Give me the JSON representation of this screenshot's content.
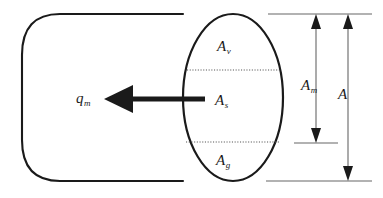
{
  "figure": {
    "type": "cylinder-cross-section-area-diagram",
    "colors": {
      "outline": "#1a1a1a",
      "dotted_divider": "#555555",
      "dimension_line": "#555555",
      "arrow": "#1a1a1a",
      "background": "#ffffff"
    }
  },
  "labels": {
    "area_vapour": {
      "base": "A",
      "sub": "v"
    },
    "area_solid": {
      "base": "A",
      "sub": "s"
    },
    "area_gas": {
      "base": "A",
      "sub": "g"
    },
    "mass_flux": {
      "base": "q",
      "sub": "m"
    },
    "area_middle": {
      "base": "A",
      "sub": "m"
    },
    "area_total": {
      "base": "A",
      "sub": ""
    }
  },
  "geometry": {
    "front_face": {
      "cx": 233,
      "cy": 97.5,
      "rx": 50,
      "ry": 83.5
    },
    "dividers_y": [
      70,
      142
    ],
    "cylinder_top_y": 14,
    "cylinder_bottom_y": 181,
    "cylinder_back_x": 22,
    "flow_arrow": {
      "tail_x": 205,
      "head_x": 104,
      "y": 99
    },
    "dimension_am_x": 316,
    "dimension_a_x": 348,
    "dimension_am_bottom_y": 143,
    "extension_top_y": 14,
    "extension_bottom_y": 181
  }
}
